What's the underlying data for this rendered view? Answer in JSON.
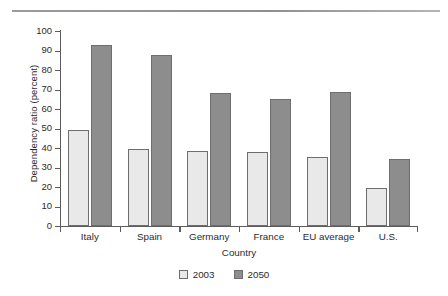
{
  "chart_data": {
    "type": "bar",
    "title": "",
    "xlabel": "Country",
    "ylabel": "Dependency ratio (percent)",
    "categories": [
      "Italy",
      "Spain",
      "Germany",
      "France",
      "EU average",
      "U.S."
    ],
    "series": [
      {
        "name": "2003",
        "color": "#e9e9e9",
        "values": [
          49,
          39.5,
          38.5,
          38,
          35.5,
          19.5
        ]
      },
      {
        "name": "2050",
        "color": "#8d8d8d",
        "values": [
          93,
          87.5,
          68,
          65,
          68.5,
          34.5
        ]
      }
    ],
    "ylim": [
      0,
      100
    ],
    "yticks": [
      0,
      10,
      20,
      30,
      40,
      50,
      60,
      70,
      80,
      90,
      100
    ],
    "ytick_labels": [
      "0",
      "10",
      "20",
      "30",
      "40",
      "50",
      "60",
      "70",
      "80",
      "90",
      "100"
    ],
    "grid": false,
    "legend_position": "bottom",
    "legend": [
      "2003",
      "2050"
    ]
  }
}
